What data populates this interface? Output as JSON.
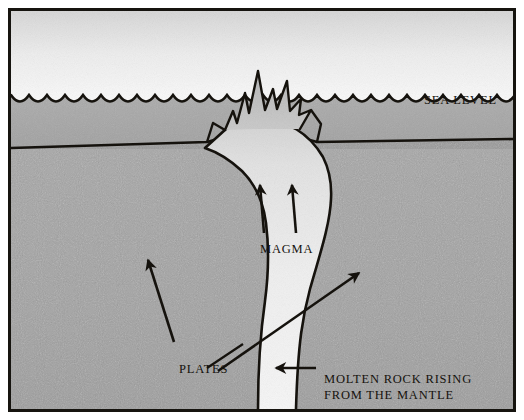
{
  "figure": {
    "width": 524,
    "height": 420
  },
  "labels": {
    "sea_level": "SEA LEVEL",
    "magma": "MAGMA",
    "plates": "PLATES",
    "molten_line1": "MOLTEN ROCK RISING",
    "molten_line2": "FROM THE MANTLE"
  },
  "colors": {
    "ink": "#15120d",
    "frame": "#16140f",
    "sky_top": "#d9d9d9",
    "sky_bottom": "#f7f7f7",
    "water": "#a8a8a8",
    "crust": "#9a9a9a",
    "mantle": "#a3a3a3",
    "conduit": "#e8e8e8",
    "magma_top": "#d2d2d2"
  },
  "elements": {
    "sky": "sky-region",
    "water": "ocean-water-region",
    "seafloor": "seafloor-crust-region",
    "mantle": "mantle-region",
    "conduit": "magma-conduit",
    "eruption": "eruption-plume",
    "wave_line": "sea-surface-wave-line",
    "magma_arrows": [
      "magma-arrow-left",
      "magma-arrow-right"
    ],
    "plate_arrows": [
      "plate-arrow-left",
      "plate-arrow-right"
    ],
    "molten_arrow": "molten-rock-arrow",
    "leaders": [
      "plates-leader-line"
    ]
  }
}
